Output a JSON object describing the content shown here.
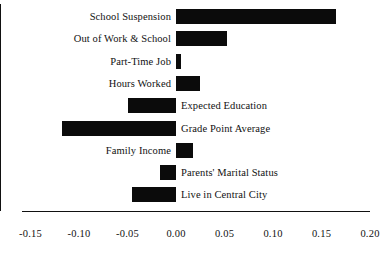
{
  "chart_data": {
    "type": "bar",
    "orientation": "horizontal",
    "title": "",
    "subtitle": "",
    "xlabel": "",
    "ylabel": "",
    "xlim": [
      -0.15,
      0.2
    ],
    "grid": false,
    "legend": null,
    "categories": [
      "School Suspension",
      "Out of Work & School",
      "Part-Time Job",
      "Hours Worked",
      "Expected Education",
      "Grade Point Average",
      "Family Income",
      "Parents' Marital Status",
      "Live in Central City"
    ],
    "values": [
      0.165,
      0.053,
      0.005,
      0.025,
      -0.05,
      -0.118,
      0.018,
      -0.017,
      -0.045
    ],
    "tick_labels": [
      "-0.15",
      "-0.10",
      "-0.05",
      "0.00",
      "0.05",
      "0.10",
      "0.15",
      "0.20"
    ],
    "tick_values": [
      -0.15,
      -0.1,
      -0.05,
      0.0,
      0.05,
      0.1,
      0.15,
      0.2
    ],
    "bar_color": "#0b0b0b",
    "background_color": "#ffffff",
    "axis_color": "#111111"
  }
}
